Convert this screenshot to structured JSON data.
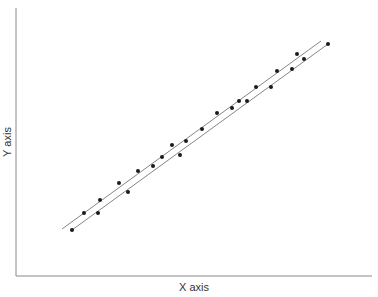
{
  "chart_data": {
    "type": "scatter",
    "title": "",
    "xlabel": "X axis",
    "ylabel": "Y axis",
    "grid": false,
    "legend": null,
    "ticks": "none",
    "points": [
      {
        "x": 72,
        "y": 230
      },
      {
        "x": 84,
        "y": 213
      },
      {
        "x": 98,
        "y": 213
      },
      {
        "x": 100,
        "y": 200
      },
      {
        "x": 119,
        "y": 183
      },
      {
        "x": 128,
        "y": 192
      },
      {
        "x": 138,
        "y": 171
      },
      {
        "x": 153,
        "y": 166
      },
      {
        "x": 162,
        "y": 157
      },
      {
        "x": 172,
        "y": 145
      },
      {
        "x": 180,
        "y": 155
      },
      {
        "x": 186,
        "y": 141
      },
      {
        "x": 202,
        "y": 129
      },
      {
        "x": 217,
        "y": 113
      },
      {
        "x": 232,
        "y": 108
      },
      {
        "x": 239,
        "y": 101
      },
      {
        "x": 247,
        "y": 101
      },
      {
        "x": 256,
        "y": 87
      },
      {
        "x": 271,
        "y": 87
      },
      {
        "x": 277,
        "y": 71
      },
      {
        "x": 292,
        "y": 69
      },
      {
        "x": 297,
        "y": 54
      },
      {
        "x": 304,
        "y": 59
      },
      {
        "x": 328,
        "y": 44
      }
    ],
    "lines": [
      {
        "name": "fit-line-upper",
        "x1": 62,
        "y1": 229,
        "x2": 321,
        "y2": 41
      },
      {
        "name": "fit-line-lower",
        "x1": 72,
        "y1": 230,
        "x2": 328,
        "y2": 44
      }
    ],
    "colors": {
      "axis": "#888888",
      "point": "#1a1a1a",
      "line": "#777777",
      "label": "#333333"
    }
  },
  "axes": {
    "x_label": "X axis",
    "y_label": "Y axis"
  }
}
